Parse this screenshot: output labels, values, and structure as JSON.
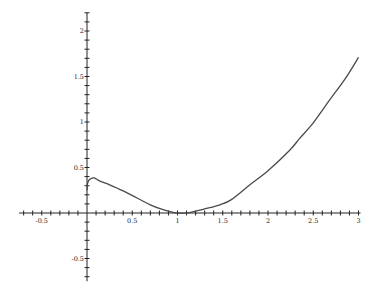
{
  "chart_data": {
    "type": "line",
    "title": "",
    "xlabel": "",
    "ylabel": "",
    "xlim": [
      -0.75,
      3.0
    ],
    "ylim": [
      -0.75,
      2.2
    ],
    "grid": false,
    "legend": null,
    "x_tick_labels": [
      {
        "value": -0.5,
        "label": "-0.5"
      },
      {
        "value": 0.5,
        "label": "0.5"
      },
      {
        "value": 1,
        "label": "1"
      },
      {
        "value": 1.5,
        "label": "1.5"
      },
      {
        "value": 2,
        "label": "2"
      },
      {
        "value": 2.5,
        "label": "2.5"
      },
      {
        "value": 3,
        "label": "3"
      }
    ],
    "y_tick_labels": [
      {
        "value": 2,
        "label": "2"
      },
      {
        "value": 1.5,
        "label": "1.5"
      },
      {
        "value": 1,
        "label": "1"
      },
      {
        "value": 0.5,
        "label": "0.5"
      },
      {
        "value": -0.5,
        "label": "-0.5"
      }
    ],
    "minor_tick_step": 0.1,
    "series": [
      {
        "name": "f(x)",
        "color": "#4a4a4a",
        "x": [
          0.0,
          0.005,
          0.02,
          0.05,
          0.08,
          0.144,
          0.25,
          0.36,
          0.486,
          0.6,
          0.7,
          0.8,
          0.92,
          1.0,
          1.1,
          1.2,
          1.3,
          1.47,
          1.6,
          1.8,
          2.0,
          2.24,
          2.35,
          2.5,
          2.68,
          2.85,
          3.0
        ],
        "y": [
          0.25,
          0.32,
          0.36,
          0.38,
          0.385,
          0.35,
          0.31,
          0.26,
          0.2,
          0.14,
          0.09,
          0.05,
          0.015,
          0.0,
          0.0,
          0.02,
          0.045,
          0.09,
          0.15,
          0.31,
          0.465,
          0.69,
          0.82,
          0.99,
          1.24,
          1.47,
          1.71
        ]
      }
    ]
  }
}
